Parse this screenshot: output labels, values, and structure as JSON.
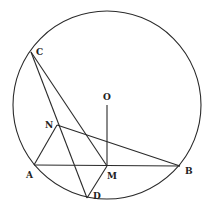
{
  "diagram": {
    "type": "geometry",
    "circle": {
      "center": "O",
      "cx": 107,
      "cy": 105,
      "r": 94
    },
    "points": {
      "A": {
        "x": 34,
        "y": 165,
        "label": "A",
        "lx": 26,
        "ly": 178
      },
      "B": {
        "x": 180,
        "y": 166,
        "label": "B",
        "lx": 185,
        "ly": 174
      },
      "C": {
        "x": 31,
        "y": 52,
        "label": "C",
        "lx": 36,
        "ly": 54
      },
      "D": {
        "x": 87,
        "y": 198,
        "label": "D",
        "lx": 93,
        "ly": 199
      },
      "M": {
        "x": 107,
        "y": 166,
        "label": "M",
        "lx": 107,
        "ly": 178
      },
      "N": {
        "x": 57,
        "y": 125,
        "label": "N",
        "lx": 45,
        "ly": 128
      },
      "O": {
        "x": 107,
        "y": 105,
        "label": "O",
        "lx": 103,
        "ly": 99
      }
    },
    "segments": [
      [
        "A",
        "B"
      ],
      [
        "C",
        "D"
      ],
      [
        "C",
        "M"
      ],
      [
        "N",
        "A"
      ],
      [
        "N",
        "B"
      ],
      [
        "M",
        "D"
      ],
      [
        "O",
        "M"
      ]
    ]
  }
}
